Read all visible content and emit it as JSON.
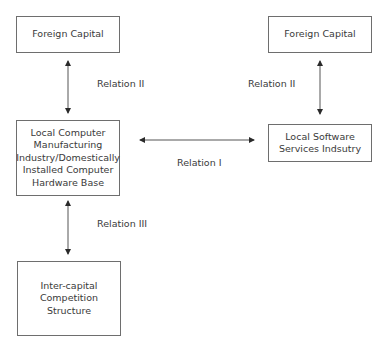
{
  "diagram": {
    "nodes": {
      "foreign_capital_left": {
        "label": "Foreign Capital"
      },
      "foreign_capital_right": {
        "label": "Foreign Capital"
      },
      "local_computer": {
        "label_lines": [
          "Local Computer",
          "Manufacturing",
          "Industry/Domestically",
          "Installed Computer",
          "Hardware Base"
        ]
      },
      "local_software": {
        "label_lines": [
          "Local Software",
          "Services Indsutry"
        ]
      },
      "inter_capital": {
        "label_lines": [
          "Inter-capital",
          "Competition",
          "Structure"
        ]
      }
    },
    "edges": {
      "left_relation_ii": {
        "label": "Relation II",
        "from": "foreign_capital_left",
        "to": "local_computer",
        "direction": "both"
      },
      "right_relation_ii": {
        "label": "Relation II",
        "from": "foreign_capital_right",
        "to": "local_software",
        "direction": "both"
      },
      "relation_i": {
        "label": "Relation I",
        "from": "local_computer",
        "to": "local_software",
        "direction": "both"
      },
      "relation_iii": {
        "label": "Relation III",
        "from": "local_computer",
        "to": "inter_capital",
        "direction": "both"
      }
    },
    "colors": {
      "line": "#3a3a3a",
      "box_border": "#6e6e6e",
      "text": "#3a3a3a"
    }
  }
}
